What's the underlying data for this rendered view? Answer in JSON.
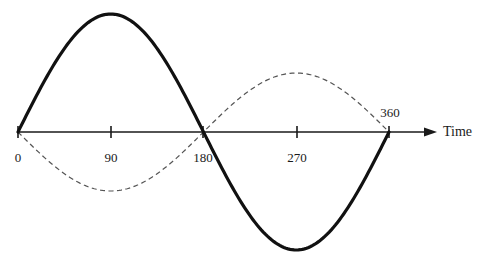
{
  "diagram": {
    "type": "sine-waves-phase-opposition",
    "axis": {
      "label": "Time",
      "ticks": [
        {
          "value": 0,
          "label": "0",
          "x": 18,
          "label_y": 150
        },
        {
          "value": 90,
          "label": "90",
          "x": 111,
          "label_y": 150
        },
        {
          "value": 180,
          "label": "180",
          "x": 203,
          "label_y": 150
        },
        {
          "value": 270,
          "label": "270",
          "x": 297,
          "label_y": 150
        },
        {
          "value": 360,
          "label": "360",
          "x": 389,
          "label_y": 105
        }
      ]
    },
    "curves": [
      {
        "name": "solid-wave",
        "style": "solid",
        "amplitude_px": 118,
        "phase": "sin",
        "color": "#111111"
      },
      {
        "name": "dashed-wave",
        "style": "dashed",
        "amplitude_px": 59,
        "phase": "-sin",
        "color": "#555555"
      }
    ]
  }
}
